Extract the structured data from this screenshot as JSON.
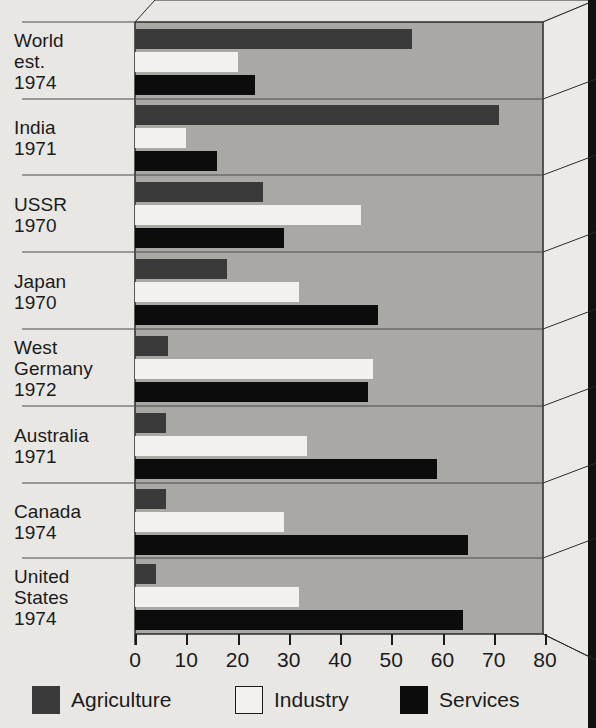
{
  "chart_data": {
    "type": "bar",
    "orientation": "horizontal",
    "title": "",
    "xlabel": "",
    "ylabel": "",
    "xlim": [
      0,
      80
    ],
    "xticks": [
      0,
      10,
      20,
      30,
      40,
      50,
      60,
      70,
      80
    ],
    "xtick_labels": [
      "0",
      "10",
      "20",
      "30",
      "40",
      "50",
      "60",
      "70",
      "80"
    ],
    "grid": false,
    "legend_position": "bottom",
    "categories": [
      "World est. 1974",
      "India 1971",
      "USSR 1970",
      "Japan 1970",
      "West Germany 1972",
      "Australia 1971",
      "Canada 1974",
      "United States 1974"
    ],
    "category_lines": [
      [
        "World",
        "est.",
        "1974"
      ],
      [
        "India",
        "1971"
      ],
      [
        "USSR",
        "1970"
      ],
      [
        "Japan",
        "1970"
      ],
      [
        "West",
        "Germany",
        "1972"
      ],
      [
        "Australia",
        "1971"
      ],
      [
        "Canada",
        "1974"
      ],
      [
        "United",
        "States",
        "1974"
      ]
    ],
    "series": [
      {
        "name": "Agriculture",
        "color": "#3a3a3a",
        "values": [
          54,
          71,
          25,
          18,
          6.5,
          6,
          6,
          4
        ]
      },
      {
        "name": "Industry",
        "color": "#f2f1ee",
        "values": [
          20,
          10,
          44,
          32,
          46.5,
          33.5,
          29,
          32
        ]
      },
      {
        "name": "Services",
        "color": "#0c0c0c",
        "values": [
          23.5,
          16,
          29,
          47.5,
          45.5,
          59,
          65,
          64
        ]
      }
    ]
  },
  "legend": {
    "items": [
      {
        "label": "Agriculture",
        "swatch": "agri"
      },
      {
        "label": "Industry",
        "swatch": "ind"
      },
      {
        "label": "Services",
        "swatch": "serv"
      }
    ]
  },
  "colors": {
    "background": "#e8e7e3",
    "panel": "#a9a8a4",
    "agriculture": "#3a3a3a",
    "industry": "#f2f1ee",
    "services": "#0c0c0c",
    "axis": "#1b1b1b"
  }
}
